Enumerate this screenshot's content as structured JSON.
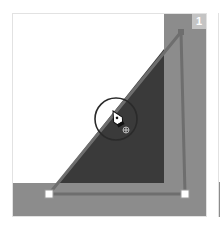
{
  "step": {
    "number": "1"
  },
  "artwork": {
    "background_color": "#ffffff",
    "band_color": "#8c8c8c",
    "fill_color": "#3a3a3a",
    "path_color": "#6e6e6e",
    "anchor_color": "#ffffff"
  },
  "tool": {
    "name": "pen-tool",
    "cursor_modifier": "+"
  }
}
